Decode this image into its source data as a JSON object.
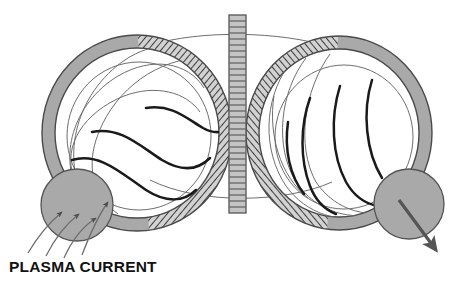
{
  "diagram": {
    "title_caption": "PLASMA CURRENT",
    "type": "technical-illustration",
    "colors": {
      "background": "#ffffff",
      "ring_fill": "#a9a9a9",
      "ring_stroke": "#4a4a4a",
      "hatch_stroke": "#3c3c3c",
      "hatch_fill": "#c8c8c8",
      "column_fill": "#c4c4c4",
      "column_stroke": "#555555",
      "field_line": "#1a1a1a",
      "guide_line": "#6e6e6e",
      "blob_fill": "#a9a9a9",
      "blob_stroke": "#555555",
      "arrow_fill": "#555555",
      "text": "#111111"
    },
    "left_torus": {
      "label": "left-torus",
      "center_x": 137,
      "center_y": 133,
      "outer_rx": 95,
      "outer_ry": 98,
      "ring_thickness": 13,
      "hatch_side": "right",
      "field_line_count": 3,
      "guide_arc_count": 4
    },
    "right_torus": {
      "label": "right-torus",
      "center_x": 339,
      "center_y": 133,
      "outer_rx": 93,
      "outer_ry": 97,
      "ring_thickness": 13,
      "hatch_side": "left",
      "field_line_count": 4,
      "guide_arc_count": 4
    },
    "center_column": {
      "label": "central-hatched-column",
      "x": 229,
      "y": 15,
      "width": 17,
      "height": 198,
      "rung_count": 33
    },
    "left_blob": {
      "label": "plasma-current-inflow-region",
      "center_x": 77,
      "center_y": 205,
      "radius": 36,
      "streamline_count": 4,
      "arrow_direction": "up-right-inward"
    },
    "right_blob": {
      "label": "plasma-current-outflow-region",
      "center_x": 409,
      "center_y": 204,
      "radius": 35,
      "arrow_direction": "down-right-outward"
    },
    "connector_arcs": {
      "top_label": "upper-connecting-field-arc",
      "bottom_label": "lower-connecting-field-arc"
    }
  }
}
